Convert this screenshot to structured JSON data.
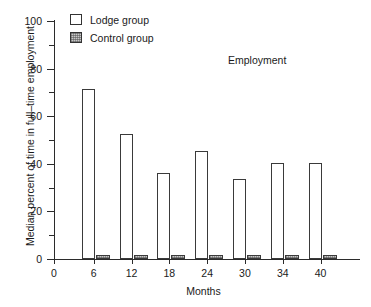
{
  "chart_data": {
    "type": "bar",
    "title": "",
    "annotation": "Employment",
    "xlabel": "Months",
    "ylabel": "Median percent of time in full–time employment",
    "categories": [
      "6",
      "12",
      "18",
      "24",
      "30",
      "34",
      "40"
    ],
    "ylim": [
      0,
      100
    ],
    "xlim": [
      0,
      46
    ],
    "y_ticks_major": [
      0,
      20,
      40,
      60,
      80,
      100
    ],
    "y_ticks_minor": [
      10,
      30,
      50,
      70,
      90
    ],
    "y_tick_labels": [
      "0",
      "20",
      "40",
      "60",
      "80",
      "100"
    ],
    "x_tick_labels": [
      "0",
      "6",
      "12",
      "18",
      "24",
      "30",
      "34",
      "40"
    ],
    "grid": false,
    "legend_position": "top-left",
    "series": [
      {
        "name": "Lodge group",
        "values": [
          71.5,
          52.5,
          36.0,
          45.5,
          33.5,
          40.5,
          40.5
        ]
      },
      {
        "name": "Control group",
        "values": [
          1.5,
          1.5,
          1.5,
          1.5,
          1.5,
          1.5,
          1.5
        ]
      }
    ]
  },
  "legend": {
    "items": [
      {
        "label": "Lodge group",
        "swatch": "open-square-swatch"
      },
      {
        "label": "Control group",
        "swatch": "stippled-square-swatch"
      }
    ]
  },
  "colors": {
    "axis": "#2b2b2b",
    "bar_outline": "#3a3a3a",
    "lodge_fill": "#ffffff",
    "control_fill": "#c9c9c9",
    "text": "#1a1a1a",
    "background": "#ffffff"
  }
}
